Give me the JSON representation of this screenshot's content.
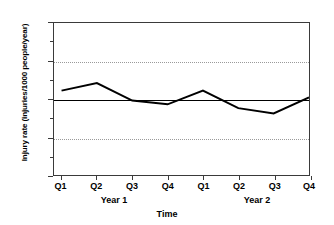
{
  "chart_data": {
    "type": "line",
    "title": "",
    "xlabel": "Time",
    "ylabel": "Injury rate (injuries/1000 people/year)",
    "categories": [
      "Q1",
      "Q2",
      "Q3",
      "Q4",
      "Q1",
      "Q2",
      "Q3",
      "Q4"
    ],
    "group_labels": [
      "Year 1",
      "Year 2"
    ],
    "series": [
      {
        "name": "Injury rate",
        "values": [
          111,
          121,
          98,
          93,
          111,
          88,
          81,
          102
        ],
        "color": "#000000"
      }
    ],
    "ylim": [
      0,
      200
    ],
    "yticks": [
      0,
      50,
      100,
      150,
      200
    ],
    "ytick_labels": [
      "0",
      "50",
      "100",
      "150",
      "200"
    ],
    "y_minor_ticks": [
      25,
      75,
      125,
      175
    ],
    "gridlines": [
      50,
      150
    ],
    "grid": true,
    "grid_style": "dotted",
    "reference_line": {
      "value": 100,
      "style": "solid",
      "color": "#000000"
    },
    "legend": null,
    "legend_position": "none"
  }
}
